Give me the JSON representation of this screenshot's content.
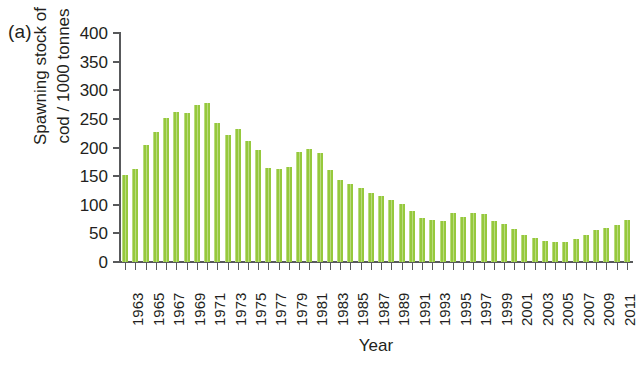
{
  "panel": {
    "label": "(a)"
  },
  "chart_data": {
    "type": "bar",
    "title": "",
    "xlabel": "Year",
    "ylabel": "Spawning stock of\ncod / 1000 tonnes",
    "ylim": [
      0,
      400
    ],
    "yticks": [
      0,
      50,
      100,
      150,
      200,
      250,
      300,
      350,
      400
    ],
    "ytick_labels": [
      "0",
      "50",
      "100",
      "150",
      "200",
      "250",
      "300",
      "350",
      "400"
    ],
    "grid": false,
    "legend": "none",
    "bar_color": "#96c93d",
    "axis_color": "#58595b",
    "xtick_labels": [
      "1963",
      "1965",
      "1967",
      "1969",
      "1971",
      "1973",
      "1975",
      "1977",
      "1979",
      "1981",
      "1983",
      "1985",
      "1987",
      "1989",
      "1991",
      "1993",
      "1995",
      "1997",
      "1999",
      "2001",
      "2003",
      "2005",
      "2007",
      "2009",
      "2011"
    ],
    "categories": [
      1963,
      1964,
      1965,
      1966,
      1967,
      1968,
      1969,
      1970,
      1971,
      1972,
      1973,
      1974,
      1975,
      1976,
      1977,
      1978,
      1979,
      1980,
      1981,
      1982,
      1983,
      1984,
      1985,
      1986,
      1987,
      1988,
      1989,
      1990,
      1991,
      1992,
      1993,
      1994,
      1995,
      1996,
      1997,
      1998,
      1999,
      2000,
      2001,
      2002,
      2003,
      2004,
      2005,
      2006,
      2007,
      2008,
      2009,
      2010,
      2011,
      2012
    ],
    "values": [
      152,
      163,
      204,
      227,
      251,
      262,
      260,
      274,
      277,
      242,
      222,
      233,
      212,
      196,
      164,
      163,
      166,
      192,
      197,
      191,
      160,
      144,
      136,
      130,
      121,
      115,
      108,
      101,
      89,
      77,
      73,
      72,
      85,
      79,
      86,
      83,
      72,
      66,
      57,
      47,
      42,
      36,
      35,
      35,
      41,
      48,
      56,
      60,
      65,
      73
    ]
  }
}
